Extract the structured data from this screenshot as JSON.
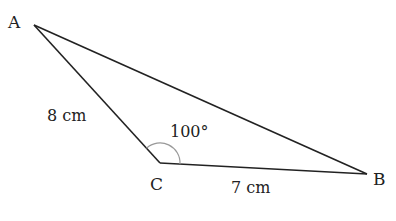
{
  "diagram": {
    "type": "triangle",
    "vertices": {
      "A": {
        "label": "A"
      },
      "B": {
        "label": "B"
      },
      "C": {
        "label": "C"
      }
    },
    "sides": {
      "AC": {
        "label": "8 cm",
        "length": 8,
        "unit": "cm"
      },
      "CB": {
        "label": "7 cm",
        "length": 7,
        "unit": "cm"
      }
    },
    "angle_C": {
      "label": "100°",
      "degrees": 100
    },
    "colors": {
      "line": "#222222",
      "arc": "#999999"
    }
  }
}
